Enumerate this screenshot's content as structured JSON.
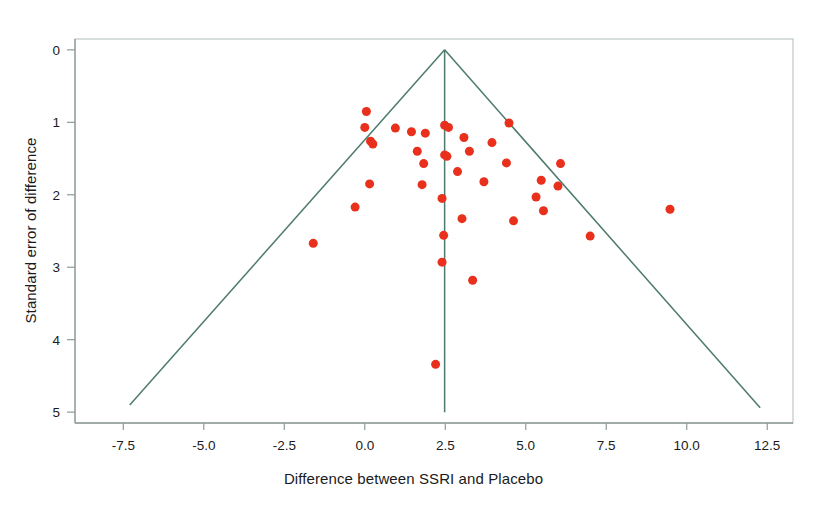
{
  "figure": {
    "kind": "funnel-plot",
    "background_color": "#ffffff"
  },
  "axes": {
    "x_title": "Difference between SSRI and Placebo",
    "y_title": "Standard error of difference",
    "x_ticks": [
      "-7.5",
      "-5.0",
      "-2.5",
      "0.0",
      "2.5",
      "5.0",
      "7.5",
      "10.0",
      "12.5"
    ],
    "y_ticks": [
      "0",
      "1",
      "2",
      "3",
      "4",
      "5"
    ]
  },
  "colors": {
    "marker": "#e8301c",
    "line": "#4c7a6c",
    "frame": "#b9c4c0",
    "text": "#1b1b1b"
  },
  "chart_data": {
    "type": "scatter",
    "title": "",
    "xlabel": "Difference between SSRI and Placebo",
    "ylabel": "Standard error of difference",
    "xlim": [
      -9.0,
      13.3
    ],
    "ylim": [
      5.15,
      -0.15
    ],
    "y_inverted": true,
    "grid": false,
    "legend": null,
    "xticks": [
      -7.5,
      -5.0,
      -2.5,
      0.0,
      2.5,
      5.0,
      7.5,
      10.0,
      12.5
    ],
    "yticks": [
      0,
      1,
      2,
      3,
      4,
      5
    ],
    "series": [
      {
        "name": "Trials",
        "marker": "circle",
        "marker_color": "#e8301c",
        "marker_size": 9,
        "points": [
          [
            0.05,
            0.85
          ],
          [
            0.0,
            1.07
          ],
          [
            0.18,
            1.26
          ],
          [
            0.25,
            1.3
          ],
          [
            0.95,
            1.08
          ],
          [
            1.45,
            1.13
          ],
          [
            1.88,
            1.15
          ],
          [
            1.63,
            1.4
          ],
          [
            1.83,
            1.57
          ],
          [
            2.48,
            1.04
          ],
          [
            2.6,
            1.07
          ],
          [
            2.48,
            1.45
          ],
          [
            2.55,
            1.47
          ],
          [
            3.08,
            1.21
          ],
          [
            2.88,
            1.68
          ],
          [
            3.95,
            1.28
          ],
          [
            3.25,
            1.4
          ],
          [
            2.4,
            2.05
          ],
          [
            1.78,
            1.86
          ],
          [
            3.7,
            1.82
          ],
          [
            4.48,
            1.01
          ],
          [
            4.4,
            1.56
          ],
          [
            5.48,
            1.8
          ],
          [
            5.32,
            2.03
          ],
          [
            6.08,
            1.57
          ],
          [
            6.0,
            1.88
          ],
          [
            5.55,
            2.22
          ],
          [
            0.15,
            1.85
          ],
          [
            -0.3,
            2.17
          ],
          [
            3.02,
            2.33
          ],
          [
            4.62,
            2.36
          ],
          [
            2.45,
            2.56
          ],
          [
            -1.6,
            2.67
          ],
          [
            7.0,
            2.57
          ],
          [
            2.4,
            2.93
          ],
          [
            9.48,
            2.2
          ],
          [
            3.35,
            3.18
          ],
          [
            2.2,
            4.34
          ]
        ]
      }
    ],
    "reference_lines": [
      {
        "name": "pooled-effect-line",
        "orientation": "vertical",
        "x": 2.48,
        "y_from": 0.0,
        "y_to": 5.0,
        "color": "#4c7a6c"
      },
      {
        "name": "funnel-left-bound",
        "from": [
          2.48,
          0.0
        ],
        "to": [
          -7.3,
          4.9
        ],
        "color": "#4c7a6c"
      },
      {
        "name": "funnel-right-bound",
        "from": [
          2.48,
          0.0
        ],
        "to": [
          12.28,
          4.94
        ],
        "color": "#4c7a6c"
      }
    ]
  }
}
